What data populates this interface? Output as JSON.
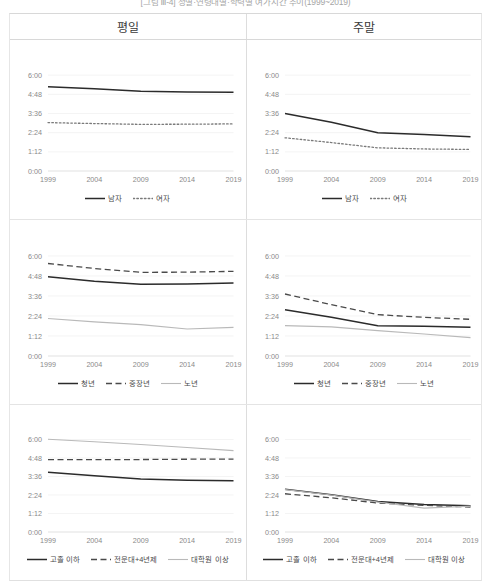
{
  "figure": {
    "title": "[그림 Ⅲ-4] 성별·연령대별·학력별 여가시간 추이(1999~2019)"
  },
  "columns": [
    {
      "key": "weekday",
      "label": "평일"
    },
    {
      "key": "weekend",
      "label": "주말"
    }
  ],
  "y_ticks": [
    "0:00",
    "1:12",
    "2:24",
    "3:36",
    "4:48",
    "6:00"
  ],
  "x_ticks": [
    "1999",
    "2004",
    "2009",
    "2014",
    "2019"
  ],
  "chart_data": [
    {
      "id": "gender-weekday",
      "type": "line",
      "title": "평일",
      "xlabel": "",
      "ylabel": "",
      "x": [
        1999,
        2004,
        2009,
        2014,
        2019
      ],
      "ylim": [
        0,
        7.2
      ],
      "ytick_values": [
        0,
        1.2,
        2.4,
        3.6,
        4.8,
        6.0
      ],
      "ytick_labels": [
        "0:00",
        "1:12",
        "2:24",
        "3:36",
        "4:48",
        "6:00"
      ],
      "grid": true,
      "legend_position": "bottom",
      "series": [
        {
          "name": "남자",
          "style": "solid",
          "values": [
            5.28,
            5.15,
            5.0,
            4.95,
            4.93
          ],
          "value_labels": [
            "5:17",
            "5:09",
            "5:00",
            "4:57",
            "4:56"
          ]
        },
        {
          "name": "여자",
          "style": "dotted",
          "values": [
            3.03,
            2.97,
            2.92,
            2.93,
            2.95
          ],
          "value_labels": [
            "3:02",
            "2:58",
            "2:55",
            "2:56",
            "2:57"
          ]
        }
      ]
    },
    {
      "id": "gender-weekend",
      "type": "line",
      "title": "주말",
      "xlabel": "",
      "ylabel": "",
      "x": [
        1999,
        2004,
        2009,
        2014,
        2019
      ],
      "ylim": [
        0,
        7.2
      ],
      "ytick_values": [
        0,
        1.2,
        2.4,
        3.6,
        4.8,
        6.0
      ],
      "ytick_labels": [
        "0:00",
        "1:12",
        "2:24",
        "3:36",
        "4:48",
        "6:00"
      ],
      "grid": true,
      "legend_position": "bottom",
      "series": [
        {
          "name": "남자",
          "style": "solid",
          "values": [
            3.6,
            3.05,
            2.4,
            2.28,
            2.15
          ],
          "value_labels": [
            "3:36",
            "3:03",
            "2:24",
            "2:17",
            "2:09"
          ]
        },
        {
          "name": "여자",
          "style": "dotted",
          "values": [
            2.08,
            1.78,
            1.45,
            1.38,
            1.35
          ],
          "value_labels": [
            "2:05",
            "1:47",
            "1:27",
            "1:23",
            "1:21"
          ]
        }
      ]
    },
    {
      "id": "age-weekday",
      "type": "line",
      "title": "평일",
      "xlabel": "",
      "ylabel": "",
      "x": [
        1999,
        2004,
        2009,
        2014,
        2019
      ],
      "ylim": [
        0,
        7.2
      ],
      "ytick_values": [
        0,
        1.2,
        2.4,
        3.6,
        4.8,
        6.0
      ],
      "ytick_labels": [
        "0:00",
        "1:12",
        "2:24",
        "3:36",
        "4:48",
        "6:00"
      ],
      "grid": true,
      "legend_position": "bottom",
      "series": [
        {
          "name": "청년",
          "style": "solid",
          "values": [
            4.75,
            4.48,
            4.3,
            4.32,
            4.38
          ],
          "value_labels": [
            "4:45",
            "4:29",
            "4:18",
            "4:19",
            "4:23"
          ]
        },
        {
          "name": "중장년",
          "style": "dashed",
          "values": [
            5.55,
            5.25,
            5.02,
            5.03,
            5.08
          ],
          "value_labels": [
            "5:33",
            "5:15",
            "5:01",
            "5:02",
            "5:05"
          ]
        },
        {
          "name": "노년",
          "style": "light",
          "values": [
            2.25,
            2.05,
            1.88,
            1.62,
            1.72
          ],
          "value_labels": [
            "2:15",
            "2:03",
            "1:53",
            "1:37",
            "1:43"
          ]
        }
      ]
    },
    {
      "id": "age-weekend",
      "type": "line",
      "title": "주말",
      "xlabel": "",
      "ylabel": "",
      "x": [
        1999,
        2004,
        2009,
        2014,
        2019
      ],
      "ylim": [
        0,
        7.2
      ],
      "ytick_values": [
        0,
        1.2,
        2.4,
        3.6,
        4.8,
        6.0
      ],
      "ytick_labels": [
        "0:00",
        "1:12",
        "2:24",
        "3:36",
        "4:48",
        "6:00"
      ],
      "grid": true,
      "legend_position": "bottom",
      "series": [
        {
          "name": "청년",
          "style": "solid",
          "values": [
            2.78,
            2.32,
            1.82,
            1.78,
            1.72
          ],
          "value_labels": [
            "2:47",
            "2:19",
            "1:49",
            "1:47",
            "1:43"
          ]
        },
        {
          "name": "중장년",
          "style": "dashed",
          "values": [
            3.72,
            3.08,
            2.48,
            2.32,
            2.2
          ],
          "value_labels": [
            "3:43",
            "3:05",
            "2:29",
            "2:19",
            "2:12"
          ]
        },
        {
          "name": "노년",
          "style": "light",
          "values": [
            1.82,
            1.75,
            1.52,
            1.32,
            1.1
          ],
          "value_labels": [
            "1:49",
            "1:45",
            "1:31",
            "1:19",
            "1:06"
          ]
        }
      ]
    },
    {
      "id": "education-weekday",
      "type": "line",
      "title": "평일",
      "xlabel": "",
      "ylabel": "",
      "x": [
        1999,
        2004,
        2009,
        2014,
        2019
      ],
      "ylim": [
        0,
        7.2
      ],
      "ytick_values": [
        0,
        1.2,
        2.4,
        3.6,
        4.8,
        6.0
      ],
      "ytick_labels": [
        "0:00",
        "1:12",
        "2:24",
        "3:36",
        "4:48",
        "6:00"
      ],
      "grid": true,
      "legend_position": "bottom",
      "series": [
        {
          "name": "고졸 이하",
          "style": "solid",
          "values": [
            3.88,
            3.65,
            3.43,
            3.35,
            3.32
          ],
          "value_labels": [
            "3:53",
            "3:39",
            "3:26",
            "3:21",
            "3:19"
          ]
        },
        {
          "name": "전문대+4년제",
          "style": "dashed",
          "values": [
            4.7,
            4.7,
            4.7,
            4.72,
            4.73
          ],
          "value_labels": [
            "4:42",
            "4:42",
            "4:42",
            "4:43",
            "4:44"
          ]
        },
        {
          "name": "대학원 이상",
          "style": "light",
          "values": [
            6.02,
            5.85,
            5.68,
            5.48,
            5.28
          ],
          "value_labels": [
            "6:01",
            "5:51",
            "5:41",
            "5:29",
            "5:17"
          ]
        }
      ]
    },
    {
      "id": "education-weekend",
      "type": "line",
      "title": "주말",
      "xlabel": "",
      "ylabel": "",
      "x": [
        1999,
        2004,
        2009,
        2014,
        2019
      ],
      "ylim": [
        0,
        7.2
      ],
      "ytick_values": [
        0,
        1.2,
        2.4,
        3.6,
        4.8,
        6.0
      ],
      "ytick_labels": [
        "0:00",
        "1:12",
        "2:24",
        "3:36",
        "4:48",
        "6:00"
      ],
      "grid": true,
      "legend_position": "bottom",
      "series": [
        {
          "name": "고졸 이하",
          "style": "solid",
          "values": [
            2.78,
            2.42,
            1.98,
            1.78,
            1.7
          ],
          "value_labels": [
            "2:47",
            "2:25",
            "1:59",
            "1:47",
            "1:42"
          ]
        },
        {
          "name": "전문대+4년제",
          "style": "dashed",
          "values": [
            2.48,
            2.22,
            1.88,
            1.73,
            1.62
          ],
          "value_labels": [
            "2:29",
            "2:13",
            "1:53",
            "1:44",
            "1:37"
          ]
        },
        {
          "name": "대학원 이상",
          "style": "light",
          "values": [
            2.75,
            2.4,
            1.95,
            1.55,
            1.68
          ],
          "value_labels": [
            "2:45",
            "2:24",
            "1:57",
            "1:33",
            "1:41"
          ]
        }
      ]
    }
  ]
}
